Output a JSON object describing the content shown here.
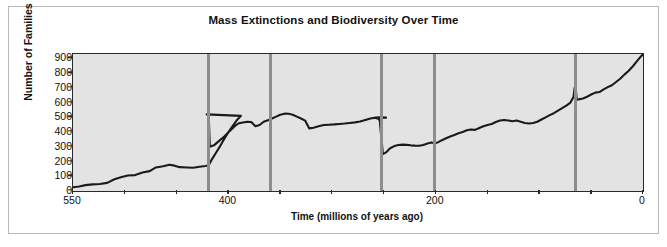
{
  "chart_data": {
    "type": "line",
    "title": "Mass Extinctions and Biodiversity Over Time",
    "xlabel": "Time (millions of years ago)",
    "ylabel": "Number of Families",
    "xlim": [
      550,
      0
    ],
    "ylim": [
      0,
      930
    ],
    "x_ticks_major": [
      550,
      400,
      200,
      0
    ],
    "x_ticks_minor": [
      500,
      450,
      350,
      300,
      250,
      150,
      100,
      50
    ],
    "y_ticks": [
      0,
      100,
      200,
      300,
      400,
      500,
      600,
      700,
      800,
      900
    ],
    "grid": false,
    "legend": "none",
    "axis_direction": "reversed",
    "line_color": "#1a1a1a",
    "plot_background": "#e3e3e3",
    "marker_color": "#8d8d8d",
    "series": [
      {
        "name": "Number of Families",
        "points": [
          [
            550,
            25
          ],
          [
            544,
            30
          ],
          [
            538,
            40
          ],
          [
            531,
            45
          ],
          [
            524,
            48
          ],
          [
            517,
            55
          ],
          [
            510,
            80
          ],
          [
            503,
            95
          ],
          [
            497,
            105
          ],
          [
            490,
            108
          ],
          [
            483,
            125
          ],
          [
            476,
            135
          ],
          [
            470,
            160
          ],
          [
            463,
            168
          ],
          [
            457,
            178
          ],
          [
            452,
            172
          ],
          [
            447,
            162
          ],
          [
            440,
            160
          ],
          [
            434,
            158
          ],
          [
            428,
            165
          ],
          [
            422,
            170
          ],
          [
            419,
            175
          ],
          [
            416,
            215
          ],
          [
            412,
            260
          ],
          [
            408,
            305
          ],
          [
            404,
            355
          ],
          [
            400,
            400
          ],
          [
            396,
            440
          ],
          [
            392,
            480
          ],
          [
            388,
            510
          ],
          [
            421,
            520
          ],
          [
            419,
            515
          ],
          [
            418,
            300
          ],
          [
            414,
            310
          ],
          [
            409,
            340
          ],
          [
            404,
            370
          ],
          [
            399,
            405
          ],
          [
            394,
            440
          ],
          [
            390,
            460
          ],
          [
            386,
            465
          ],
          [
            382,
            470
          ],
          [
            378,
            468
          ],
          [
            374,
            440
          ],
          [
            370,
            448
          ],
          [
            366,
            470
          ],
          [
            362,
            480
          ],
          [
            358,
            492
          ],
          [
            354,
            505
          ],
          [
            350,
            518
          ],
          [
            346,
            525
          ],
          [
            342,
            524
          ],
          [
            338,
            518
          ],
          [
            334,
            505
          ],
          [
            330,
            492
          ],
          [
            326,
            478
          ],
          [
            322,
            425
          ],
          [
            318,
            430
          ],
          [
            313,
            440
          ],
          [
            308,
            448
          ],
          [
            303,
            450
          ],
          [
            298,
            452
          ],
          [
            293,
            455
          ],
          [
            288,
            458
          ],
          [
            283,
            462
          ],
          [
            278,
            466
          ],
          [
            273,
            472
          ],
          [
            268,
            482
          ],
          [
            263,
            492
          ],
          [
            258,
            498
          ],
          [
            253,
            500
          ],
          [
            248,
            498
          ],
          [
            258,
            496
          ],
          [
            256,
            492
          ],
          [
            254,
            480
          ],
          [
            253,
            400
          ],
          [
            252,
            330
          ],
          [
            251,
            250
          ],
          [
            248,
            262
          ],
          [
            244,
            290
          ],
          [
            240,
            305
          ],
          [
            236,
            312
          ],
          [
            232,
            315
          ],
          [
            228,
            313
          ],
          [
            224,
            310
          ],
          [
            220,
            308
          ],
          [
            216,
            307
          ],
          [
            212,
            312
          ],
          [
            208,
            322
          ],
          [
            204,
            330
          ],
          [
            201,
            322
          ],
          [
            198,
            330
          ],
          [
            194,
            345
          ],
          [
            190,
            358
          ],
          [
            186,
            370
          ],
          [
            182,
            380
          ],
          [
            178,
            392
          ],
          [
            174,
            400
          ],
          [
            170,
            412
          ],
          [
            166,
            418
          ],
          [
            162,
            415
          ],
          [
            158,
            428
          ],
          [
            154,
            440
          ],
          [
            150,
            448
          ],
          [
            146,
            455
          ],
          [
            142,
            468
          ],
          [
            138,
            478
          ],
          [
            134,
            482
          ],
          [
            130,
            478
          ],
          [
            126,
            474
          ],
          [
            122,
            478
          ],
          [
            118,
            470
          ],
          [
            114,
            462
          ],
          [
            110,
            458
          ],
          [
            106,
            462
          ],
          [
            102,
            470
          ],
          [
            98,
            485
          ],
          [
            94,
            500
          ],
          [
            90,
            515
          ],
          [
            86,
            528
          ],
          [
            82,
            545
          ],
          [
            78,
            562
          ],
          [
            74,
            580
          ],
          [
            70,
            600
          ],
          [
            67,
            640
          ],
          [
            66,
            700
          ],
          [
            65,
            710
          ],
          [
            64,
            620
          ],
          [
            62,
            622
          ],
          [
            58,
            628
          ],
          [
            54,
            640
          ],
          [
            50,
            655
          ],
          [
            46,
            668
          ],
          [
            42,
            672
          ],
          [
            38,
            690
          ],
          [
            34,
            705
          ],
          [
            30,
            718
          ],
          [
            26,
            740
          ],
          [
            22,
            762
          ],
          [
            18,
            790
          ],
          [
            14,
            815
          ],
          [
            10,
            845
          ],
          [
            6,
            880
          ],
          [
            3,
            905
          ],
          [
            0,
            930
          ]
        ]
      }
    ],
    "extinction_markers": [
      {
        "name": "ordovician-silurian",
        "x": 419
      },
      {
        "name": "late-devonian",
        "x": 359
      },
      {
        "name": "permian-triassic",
        "x": 252
      },
      {
        "name": "triassic-jurassic",
        "x": 201
      },
      {
        "name": "cretaceous-paleogene",
        "x": 65
      }
    ]
  }
}
